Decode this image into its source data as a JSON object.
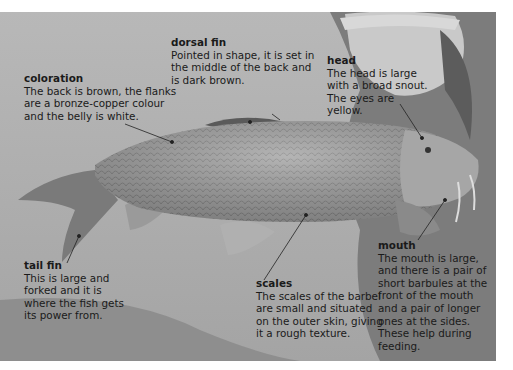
{
  "figure": {
    "palette": {
      "background": "#ffffff",
      "text": "#1a1a1a",
      "pointer": "#222222"
    }
  },
  "annotations": [
    {
      "id": "coloration",
      "title": "coloration",
      "text": "The back is brown, the flanks are a bronze-copper colour and the belly is white."
    },
    {
      "id": "dorsal-fin",
      "title": "dorsal fin",
      "text": "Pointed in shape, it is set in the middle of the back and is dark brown."
    },
    {
      "id": "head",
      "title": "head",
      "text": "The head is large with a broad snout. The eyes are yellow."
    },
    {
      "id": "tail-fin",
      "title": "tail fin",
      "text": "This is large and forked and it is where the fish gets its power from."
    },
    {
      "id": "scales",
      "title": "scales",
      "text": "The scales of the barbel are small and situated on the outer skin, giving it a rough texture."
    },
    {
      "id": "mouth",
      "title": "mouth",
      "text": "The mouth is large, and there is a pair of short barbules at the front of the mouth and a pair of longer ones at the sides. These help during feeding."
    }
  ]
}
